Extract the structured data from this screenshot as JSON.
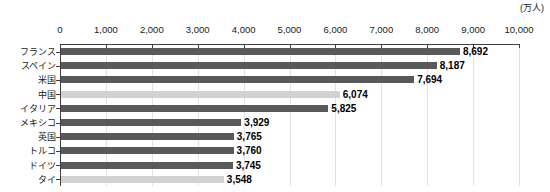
{
  "chart_data": {
    "type": "bar",
    "orientation": "horizontal",
    "title": "",
    "unit_label": "(万人)",
    "xlabel": "",
    "ylabel": "",
    "xlim": [
      0,
      10000
    ],
    "xticks": [
      "0",
      "1,000",
      "2,000",
      "3,000",
      "4,000",
      "5,000",
      "6,000",
      "7,000",
      "8,000",
      "9,000",
      "10,000"
    ],
    "xtick_values": [
      0,
      1000,
      2000,
      3000,
      4000,
      5000,
      6000,
      7000,
      8000,
      9000,
      10000
    ],
    "grid": true,
    "legend": "none",
    "axis_position": "top",
    "categories": [
      "フランス",
      "スペイン",
      "米国",
      "中国",
      "イタリア",
      "メキシコ",
      "英国",
      "トルコ",
      "ドイツ",
      "タイ"
    ],
    "values": [
      8692,
      8187,
      7694,
      6074,
      5825,
      3929,
      3765,
      3760,
      3745,
      3548
    ],
    "value_labels": [
      "8,692",
      "8,187",
      "7,694",
      "6,074",
      "5,825",
      "3,929",
      "3,765",
      "3,760",
      "3,745",
      "3,548"
    ],
    "bar_colors": [
      "#595959",
      "#595959",
      "#595959",
      "#d2d2d2",
      "#595959",
      "#595959",
      "#595959",
      "#595959",
      "#595959",
      "#d2d2d2"
    ],
    "highlight_color": "#d2d2d2",
    "primary_color": "#595959",
    "grid_color": "#e2e2e2",
    "axis_color": "#3f3f3f"
  }
}
